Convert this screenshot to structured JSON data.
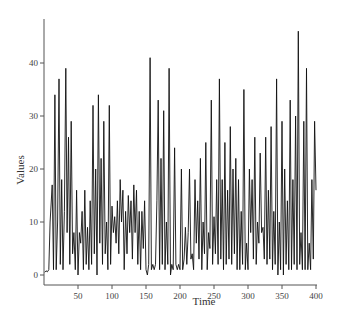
{
  "chart_data": {
    "type": "line",
    "title": "",
    "xlabel": "Time",
    "ylabel": "Values",
    "xlim": [
      0,
      400
    ],
    "ylim": [
      0,
      48
    ],
    "x_ticks": [
      50,
      100,
      150,
      200,
      250,
      300,
      350,
      400
    ],
    "y_ticks": [
      0,
      10,
      20,
      30,
      40
    ],
    "grid": false,
    "legend": null,
    "series": [
      {
        "name": "Values",
        "color": "#111111",
        "x": [
          1,
          3,
          5,
          7,
          9,
          12,
          14,
          16,
          18,
          20,
          22,
          24,
          26,
          28,
          30,
          32,
          34,
          36,
          38,
          40,
          42,
          44,
          46,
          48,
          50,
          52,
          54,
          56,
          58,
          60,
          62,
          64,
          66,
          68,
          70,
          72,
          74,
          76,
          78,
          80,
          82,
          84,
          86,
          88,
          90,
          92,
          94,
          96,
          98,
          100,
          102,
          104,
          106,
          108,
          110,
          112,
          114,
          116,
          118,
          120,
          122,
          124,
          126,
          128,
          130,
          132,
          134,
          136,
          138,
          140,
          142,
          144,
          146,
          148,
          150,
          152,
          154,
          156,
          158,
          160,
          162,
          164,
          166,
          168,
          170,
          172,
          174,
          176,
          178,
          180,
          182,
          184,
          186,
          188,
          190,
          192,
          194,
          196,
          198,
          200,
          202,
          204,
          206,
          208,
          210,
          212,
          214,
          216,
          218,
          220,
          222,
          224,
          226,
          228,
          230,
          232,
          234,
          236,
          238,
          240,
          242,
          244,
          246,
          248,
          250,
          252,
          254,
          256,
          258,
          260,
          262,
          264,
          266,
          268,
          270,
          272,
          274,
          276,
          278,
          280,
          282,
          284,
          286,
          288,
          290,
          292,
          294,
          296,
          298,
          300,
          302,
          304,
          306,
          308,
          310,
          312,
          314,
          316,
          318,
          320,
          322,
          324,
          326,
          328,
          330,
          332,
          334,
          336,
          338,
          340,
          342,
          344,
          346,
          348,
          350,
          352,
          354,
          356,
          358,
          360,
          362,
          364,
          366,
          368,
          370,
          372,
          374,
          376,
          378,
          380,
          382,
          384,
          386,
          388,
          390,
          392,
          394,
          396,
          398,
          400
        ],
        "values": [
          0.5,
          0.8,
          0.6,
          1,
          10,
          17,
          1,
          34,
          1,
          10,
          37,
          2,
          18,
          1,
          12,
          39,
          8,
          26,
          2,
          29,
          4,
          8,
          1,
          16,
          0,
          8,
          6,
          12,
          1,
          16,
          2,
          9,
          1,
          14,
          2,
          32,
          4,
          20,
          0,
          34,
          6,
          22,
          2,
          29,
          4,
          10,
          1,
          32,
          2,
          13,
          8,
          11,
          6,
          14,
          4,
          18,
          10,
          16,
          1,
          12,
          4,
          15,
          8,
          14,
          3,
          17,
          8,
          16,
          2,
          12,
          1,
          12,
          5,
          14,
          1,
          0,
          2,
          41,
          1,
          2,
          1,
          2,
          14,
          33,
          1,
          22,
          2,
          31,
          1,
          10,
          2,
          39,
          0,
          2,
          1,
          24,
          2,
          1,
          2,
          1,
          20,
          1,
          3,
          9,
          2,
          8,
          20,
          3,
          4,
          1,
          18,
          6,
          14,
          3,
          22,
          1,
          10,
          4,
          25,
          1,
          8,
          5,
          33,
          2,
          11,
          4,
          18,
          2,
          37,
          3,
          18,
          1,
          25,
          2,
          16,
          3,
          28,
          2,
          20,
          4,
          22,
          1,
          18,
          1,
          12,
          2,
          35,
          1,
          6,
          1,
          20,
          8,
          18,
          3,
          26,
          2,
          10,
          6,
          23,
          8,
          9,
          3,
          26,
          2,
          16,
          3,
          28,
          1,
          12,
          2,
          37,
          0,
          10,
          1,
          29,
          0,
          20,
          2,
          14,
          1,
          33,
          1,
          18,
          2,
          30,
          1,
          46,
          2,
          8,
          1,
          29,
          1,
          39,
          1,
          6,
          1,
          18,
          3,
          29,
          16
        ]
      }
    ]
  }
}
